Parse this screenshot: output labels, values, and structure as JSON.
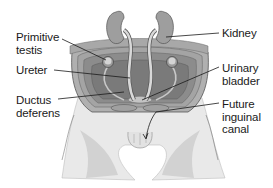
{
  "diagram": {
    "labels": [
      {
        "id": "primitive-testis",
        "text": "Primitive\ntestis",
        "side": "left"
      },
      {
        "id": "ureter",
        "text": "Ureter",
        "side": "left"
      },
      {
        "id": "ductus-deferens",
        "text": "Ductus\ndeferens",
        "side": "left"
      },
      {
        "id": "kidney",
        "text": "Kidney",
        "side": "right"
      },
      {
        "id": "urinary-bladder",
        "text": "Urinary\nbladder",
        "side": "right"
      },
      {
        "id": "future-inguinal-canal",
        "text": "Future\ninguinal\ncanal",
        "side": "right"
      }
    ],
    "colors": {
      "organ_fill": "#9a9a9a",
      "cavity_fill": "#7d7d7d",
      "wall_fill": "#b8b8b8",
      "skin_fill": "#e6e6e6",
      "skin_shadow": "#cfcfcf",
      "line": "#1a1a1a"
    }
  }
}
